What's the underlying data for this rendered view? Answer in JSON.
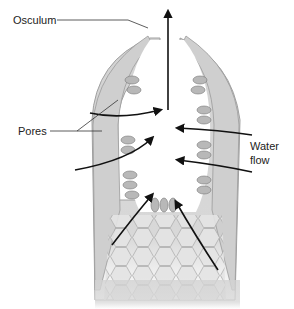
{
  "diagram": {
    "labels": {
      "osculum": "Osculum",
      "pores": "Pores",
      "water_flow_line1": "Water",
      "water_flow_line2": "flow"
    },
    "colors": {
      "body_fill": "#d4d4d4",
      "body_stroke": "#9a9a9a",
      "cell_fill": "#bdbdbd",
      "arrow": "#111111",
      "leader_line": "#333333",
      "text": "#222222"
    }
  }
}
